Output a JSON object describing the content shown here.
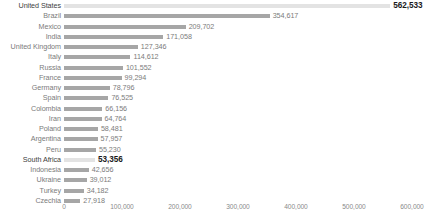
{
  "chart_data": {
    "type": "bar",
    "orientation": "horizontal",
    "title": "",
    "subtitle": "",
    "xlabel": "",
    "ylabel": "",
    "grid": false,
    "legend": null,
    "xlim": [
      0,
      600000
    ],
    "axis_ticks": [
      "0",
      "100,000",
      "200,000",
      "300,000",
      "400,000",
      "500,000",
      "600,000"
    ],
    "axis_tick_values": [
      0,
      100000,
      200000,
      300000,
      400000,
      500000,
      600000
    ],
    "categories": [
      "United States",
      "Brazil",
      "Mexico",
      "India",
      "United Kingdom",
      "Italy",
      "Russia",
      "France",
      "Germany",
      "Spain",
      "Colombia",
      "Iran",
      "Poland",
      "Argentina",
      "Peru",
      "South Africa",
      "Indonesia",
      "Ukraine",
      "Turkey",
      "Czechia"
    ],
    "values": [
      562533,
      354617,
      209702,
      171058,
      127346,
      114612,
      101552,
      99294,
      78796,
      76525,
      66156,
      64764,
      58481,
      57957,
      55230,
      53356,
      42656,
      39012,
      34182,
      27918
    ],
    "value_labels": [
      "562,533",
      "354,617",
      "209,702",
      "171,058",
      "127,346",
      "114,612",
      "101,552",
      "99,294",
      "78,796",
      "76,525",
      "66,156",
      "64,764",
      "58,481",
      "57,957",
      "55,230",
      "53,356",
      "42,656",
      "39,012",
      "34,182",
      "27,918"
    ],
    "highlighted": [
      0,
      15
    ],
    "colors": {
      "bar": "#a6a6a6",
      "bar_highlight": "#e3e3e3",
      "label": "#7b7b7b",
      "label_highlight": "#1a1a1a",
      "background": "#ffffff"
    }
  }
}
